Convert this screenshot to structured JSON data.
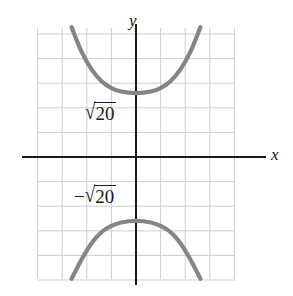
{
  "figure": {
    "background_color": "#ffffff",
    "axis_color": "#1a1a1a",
    "grid_color": "#c9cdd4",
    "curve_color": "#858585"
  },
  "axes": {
    "x_label": "x",
    "y_label": "y",
    "origin_px": {
      "x": 136,
      "y": 157
    },
    "grid_spacing_px": 24.6,
    "x_range_units": [
      -4,
      4
    ],
    "y_range_units": [
      -4.9,
      5.25
    ]
  },
  "annotations": [
    {
      "name": "positive-vertex-label",
      "sign": "",
      "radical_sign": "√",
      "radicand": "20",
      "text": "√20",
      "value_units": 2.6,
      "position_px": {
        "x": 85,
        "y": 102
      }
    },
    {
      "name": "negative-vertex-label",
      "sign": "−",
      "radical_sign": "√",
      "radicand": "20",
      "text": "−√20",
      "value_units": -2.6,
      "position_px": {
        "x": 74,
        "y": 185
      }
    }
  ],
  "chart_data": {
    "type": "line",
    "title": "",
    "xlabel": "x",
    "ylabel": "y",
    "xlim": [
      -4,
      4
    ],
    "ylim": [
      -4.9,
      5.25
    ],
    "grid": true,
    "legend": null,
    "equation": "y^2/20 - x^2/b^2 = 1",
    "vertices": [
      {
        "label": "√20",
        "x": 0,
        "y": 2.6
      },
      {
        "label": "−√20",
        "x": 0,
        "y": -2.6
      }
    ],
    "series": [
      {
        "name": "upper-branch",
        "color": "#858585",
        "points": [
          {
            "x": -2.62,
            "y": 5.28
          },
          {
            "x": -2.2,
            "y": 4.25
          },
          {
            "x": -1.8,
            "y": 3.55
          },
          {
            "x": -1.4,
            "y": 3.08
          },
          {
            "x": -1.0,
            "y": 2.8
          },
          {
            "x": -0.6,
            "y": 2.66
          },
          {
            "x": 0.0,
            "y": 2.6
          },
          {
            "x": 0.6,
            "y": 2.66
          },
          {
            "x": 1.0,
            "y": 2.8
          },
          {
            "x": 1.4,
            "y": 3.08
          },
          {
            "x": 1.8,
            "y": 3.55
          },
          {
            "x": 2.2,
            "y": 4.25
          },
          {
            "x": 2.62,
            "y": 5.28
          }
        ]
      },
      {
        "name": "lower-branch",
        "color": "#858585",
        "points": [
          {
            "x": -2.62,
            "y": -4.95
          },
          {
            "x": -2.2,
            "y": -4.15
          },
          {
            "x": -1.8,
            "y": -3.5
          },
          {
            "x": -1.4,
            "y": -3.05
          },
          {
            "x": -1.0,
            "y": -2.8
          },
          {
            "x": -0.6,
            "y": -2.66
          },
          {
            "x": 0.0,
            "y": -2.6
          },
          {
            "x": 0.6,
            "y": -2.66
          },
          {
            "x": 1.0,
            "y": -2.8
          },
          {
            "x": 1.4,
            "y": -3.05
          },
          {
            "x": 1.8,
            "y": -3.5
          },
          {
            "x": 2.2,
            "y": -4.15
          },
          {
            "x": 2.62,
            "y": -4.95
          }
        ]
      }
    ]
  }
}
